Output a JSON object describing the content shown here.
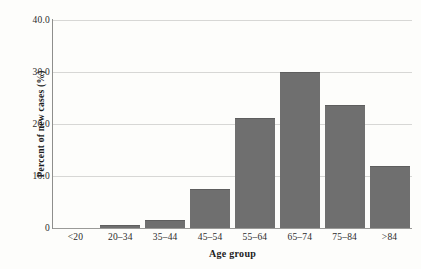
{
  "chart_data": {
    "type": "bar",
    "title": "",
    "subtitle": "",
    "xlabel": "Age group",
    "ylabel": "Percent of new cases (%)",
    "categories": [
      "<20",
      "20–34",
      "35–44",
      "45–54",
      "55–64",
      "65–74",
      "75–84",
      ">84"
    ],
    "values": [
      0,
      0.5,
      1.5,
      7.5,
      21.2,
      30.0,
      23.7,
      12.0
    ],
    "ylim": [
      0,
      40
    ],
    "xlim_note": "categorical",
    "yticks": [
      0,
      10,
      20,
      30,
      40
    ],
    "ytick_labels": [
      "0",
      "10.0",
      "20.0",
      "30.0",
      "40.0"
    ],
    "grid": "horizontal",
    "legend": "none",
    "annotations": [],
    "colors": {
      "bar_fill": "#6f6f6f",
      "bar_edge": "#5e5e5e",
      "gridline": "#d7d7d5",
      "axis_line": "#8e8e8c",
      "text": "#1c1c1c",
      "background": "#fdfdfb"
    }
  }
}
